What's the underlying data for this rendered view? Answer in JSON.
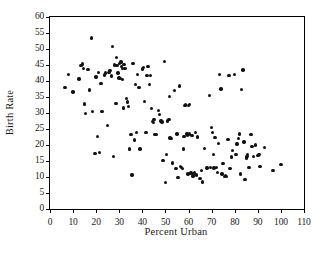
{
  "chart_data": {
    "type": "scatter",
    "title": "",
    "xlabel": "Percent Urban",
    "ylabel": "Birth Rate",
    "xlim": [
      0,
      110
    ],
    "ylim": [
      0,
      60
    ],
    "xticks": [
      0,
      10,
      20,
      30,
      40,
      50,
      60,
      70,
      80,
      90,
      100,
      110
    ],
    "yticks": [
      0,
      5,
      10,
      15,
      20,
      25,
      30,
      35,
      40,
      45,
      50,
      55,
      60
    ],
    "grid": false,
    "legend": null,
    "marker": {
      "shape": "circle",
      "color": "#111111",
      "size": 3.4
    },
    "frame": true,
    "series": [
      {
        "name": "countries",
        "points": [
          [
            6.5,
            38.0
          ],
          [
            8.0,
            42.1
          ],
          [
            10.0,
            36.6
          ],
          [
            12.5,
            40.6
          ],
          [
            13.5,
            44.9
          ],
          [
            14.0,
            45.3
          ],
          [
            14.5,
            44.0
          ],
          [
            15.0,
            32.8
          ],
          [
            15.5,
            29.8
          ],
          [
            16.5,
            43.6
          ],
          [
            17.0,
            37.2
          ],
          [
            18.0,
            53.5
          ],
          [
            18.5,
            30.4
          ],
          [
            19.5,
            17.3
          ],
          [
            20.0,
            41.2
          ],
          [
            20.5,
            22.6
          ],
          [
            21.0,
            42.6
          ],
          [
            21.5,
            17.6
          ],
          [
            22.0,
            39.3
          ],
          [
            22.5,
            30.5
          ],
          [
            23.5,
            41.9
          ],
          [
            24.0,
            42.5
          ],
          [
            25.0,
            26.1
          ],
          [
            25.5,
            42.6
          ],
          [
            26.0,
            43.2
          ],
          [
            26.5,
            41.6
          ],
          [
            27.0,
            50.7
          ],
          [
            27.5,
            16.5
          ],
          [
            28.0,
            45.0
          ],
          [
            28.5,
            33.0
          ],
          [
            28.8,
            47.3
          ],
          [
            29.0,
            44.8
          ],
          [
            29.5,
            42.5
          ],
          [
            29.8,
            41.0
          ],
          [
            30.0,
            45.5
          ],
          [
            30.5,
            40.8
          ],
          [
            30.8,
            46.0
          ],
          [
            31.0,
            44.6
          ],
          [
            31.3,
            43.9
          ],
          [
            31.5,
            40.5
          ],
          [
            31.8,
            31.6
          ],
          [
            32.0,
            45.1
          ],
          [
            32.5,
            44.0
          ],
          [
            33.0,
            34.6
          ],
          [
            33.5,
            33.4
          ],
          [
            34.0,
            32.0
          ],
          [
            34.5,
            18.8
          ],
          [
            35.0,
            23.3
          ],
          [
            35.5,
            10.6
          ],
          [
            36.0,
            45.4
          ],
          [
            36.5,
            21.6
          ],
          [
            37.0,
            39.0
          ],
          [
            37.5,
            23.9
          ],
          [
            38.0,
            42.1
          ],
          [
            38.5,
            38.0
          ],
          [
            39.0,
            18.8
          ],
          [
            40.0,
            43.7
          ],
          [
            40.5,
            44.3
          ],
          [
            41.0,
            33.6
          ],
          [
            41.5,
            23.9
          ],
          [
            42.0,
            41.7
          ],
          [
            42.5,
            44.5
          ],
          [
            43.0,
            39.0
          ],
          [
            43.5,
            41.8
          ],
          [
            44.0,
            31.5
          ],
          [
            44.5,
            27.4
          ],
          [
            44.8,
            27.0
          ],
          [
            45.0,
            28.0
          ],
          [
            45.5,
            23.2
          ],
          [
            46.0,
            23.3
          ],
          [
            47.0,
            30.7
          ],
          [
            47.5,
            29.6
          ],
          [
            48.0,
            27.5
          ],
          [
            48.5,
            27.2
          ],
          [
            49.0,
            15.1
          ],
          [
            49.5,
            46.1
          ],
          [
            50.0,
            8.2
          ],
          [
            50.5,
            17.0
          ],
          [
            51.0,
            27.5
          ],
          [
            51.5,
            28.0
          ],
          [
            51.8,
            35.1
          ],
          [
            52.0,
            22.2
          ],
          [
            52.5,
            22.0
          ],
          [
            53.0,
            14.4
          ],
          [
            54.0,
            37.0
          ],
          [
            54.5,
            12.6
          ],
          [
            55.0,
            23.5
          ],
          [
            55.5,
            9.8
          ],
          [
            56.0,
            38.4
          ],
          [
            56.5,
            13.2
          ],
          [
            57.0,
            13.0
          ],
          [
            57.5,
            12.7
          ],
          [
            57.8,
            18.8
          ],
          [
            58.0,
            22.6
          ],
          [
            58.5,
            32.3
          ],
          [
            58.8,
            32.6
          ],
          [
            59.0,
            23.2
          ],
          [
            59.3,
            23.6
          ],
          [
            59.5,
            22.9
          ],
          [
            59.8,
            11.0
          ],
          [
            60.0,
            32.4
          ],
          [
            60.3,
            32.6
          ],
          [
            60.5,
            23.4
          ],
          [
            61.0,
            11.2
          ],
          [
            61.5,
            23.0
          ],
          [
            62.0,
            10.3
          ],
          [
            62.5,
            11.3
          ],
          [
            63.0,
            24.0
          ],
          [
            63.5,
            10.6
          ],
          [
            64.0,
            22.5
          ],
          [
            65.0,
            9.5
          ],
          [
            65.5,
            12.0
          ],
          [
            66.0,
            8.4
          ],
          [
            67.0,
            19.0
          ],
          [
            68.0,
            12.8
          ],
          [
            69.0,
            35.5
          ],
          [
            69.5,
            13.0
          ],
          [
            70.0,
            25.5
          ],
          [
            70.5,
            24.0
          ],
          [
            70.8,
            17.0
          ],
          [
            71.0,
            12.8
          ],
          [
            71.5,
            22.4
          ],
          [
            72.0,
            13.0
          ],
          [
            72.5,
            11.5
          ],
          [
            73.0,
            20.5
          ],
          [
            73.5,
            42.0
          ],
          [
            74.0,
            37.5
          ],
          [
            74.5,
            11.0
          ],
          [
            75.0,
            14.3
          ],
          [
            75.5,
            10.2
          ],
          [
            76.0,
            10.4
          ],
          [
            76.5,
            10.2
          ],
          [
            77.0,
            21.8
          ],
          [
            77.5,
            41.8
          ],
          [
            78.0,
            12.6
          ],
          [
            78.5,
            16.2
          ],
          [
            79.0,
            18.3
          ],
          [
            80.0,
            42.0
          ],
          [
            80.5,
            17.0
          ],
          [
            81.0,
            20.3
          ],
          [
            81.5,
            22.0
          ],
          [
            82.0,
            23.5
          ],
          [
            82.5,
            11.0
          ],
          [
            83.0,
            37.4
          ],
          [
            83.5,
            43.5
          ],
          [
            84.0,
            21.0
          ],
          [
            84.5,
            9.3
          ],
          [
            85.0,
            16.0
          ],
          [
            85.3,
            16.5
          ],
          [
            85.6,
            17.0
          ],
          [
            86.0,
            12.9
          ],
          [
            86.5,
            13.0
          ],
          [
            87.0,
            23.3
          ],
          [
            87.5,
            19.5
          ],
          [
            88.0,
            16.5
          ],
          [
            89.0,
            20.0
          ],
          [
            90.0,
            16.8
          ],
          [
            90.5,
            17.0
          ],
          [
            91.0,
            13.2
          ],
          [
            93.0,
            19.2
          ],
          [
            96.5,
            12.0
          ],
          [
            100.0,
            13.9
          ]
        ]
      }
    ]
  }
}
